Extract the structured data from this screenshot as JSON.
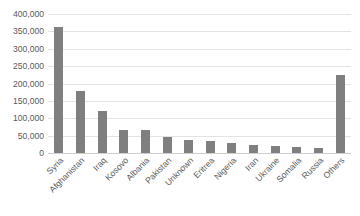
{
  "chart_data": {
    "type": "bar",
    "title": "",
    "subtitle": "",
    "xlabel": "",
    "ylabel": "",
    "ylim": [
      0,
      400000
    ],
    "ytick_step": 50000,
    "ytick_labels": [
      "400,000",
      "350,000",
      "300,000",
      "250,000",
      "200,000",
      "150,000",
      "100,000",
      "50,000",
      "0"
    ],
    "ytick_values": [
      400000,
      350000,
      300000,
      250000,
      200000,
      150000,
      100000,
      50000,
      0
    ],
    "grid": true,
    "legend": "none",
    "categories": [
      "Syria",
      "Afghanistan",
      "Iraq",
      "Kosovo",
      "Albania",
      "Pakistan",
      "Unknown",
      "Eritrea",
      "Nigeria",
      "Iran",
      "Ukraine",
      "Somalia",
      "Russia",
      "Others"
    ],
    "values": [
      362000,
      178000,
      120000,
      67000,
      65000,
      45000,
      38000,
      35000,
      28000,
      23000,
      19000,
      16000,
      15000,
      224000
    ],
    "series": [
      {
        "name": "Applications",
        "values": [
          362000,
          178000,
          120000,
          67000,
          65000,
          45000,
          38000,
          35000,
          28000,
          23000,
          19000,
          16000,
          15000,
          224000
        ]
      }
    ],
    "bar_color": "#7f7f7f",
    "gridline_color": "#e3e3e3",
    "text_color": "#595959",
    "background_color": "#ffffff",
    "xlabel_rotation": -45
  }
}
